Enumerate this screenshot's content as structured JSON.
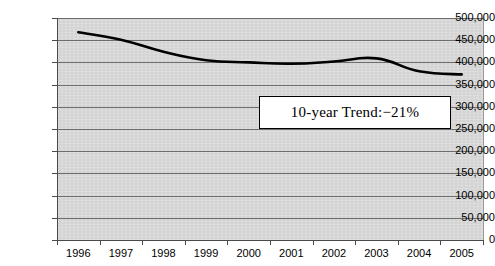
{
  "chart_data": {
    "type": "line",
    "title": "",
    "subtitle": "",
    "xlabel": "",
    "ylabel": "",
    "categories": [
      "1996",
      "1997",
      "1998",
      "1999",
      "2000",
      "2001",
      "2002",
      "2003",
      "2004",
      "2005"
    ],
    "series": [
      {
        "name": "Trend",
        "values": [
          468000,
          451000,
          424000,
          405000,
          400000,
          397000,
          402000,
          409000,
          380000,
          373000
        ]
      }
    ],
    "ylim": [
      0,
      500000
    ],
    "y_ticks": [
      0,
      50000,
      100000,
      150000,
      200000,
      250000,
      300000,
      350000,
      400000,
      450000,
      500000
    ],
    "y_tick_labels": [
      "0",
      "50,000",
      "100,000",
      "150,000",
      "200,000",
      "250,000",
      "300,000",
      "350,000",
      "400,000",
      "450,000",
      "500,000"
    ],
    "grid": true,
    "grid_axis": "y",
    "legend": false,
    "legend_position": "none",
    "plot_background_color": "#d8d8d8",
    "gridline_color": "#6e6e6e",
    "line_color": "#000000",
    "annotations": [
      {
        "text": "10-year Trend:−21%",
        "value": -21,
        "unit": "%",
        "style": "boxed",
        "box_fill": "#ffffff",
        "box_border": "#000000"
      }
    ]
  }
}
